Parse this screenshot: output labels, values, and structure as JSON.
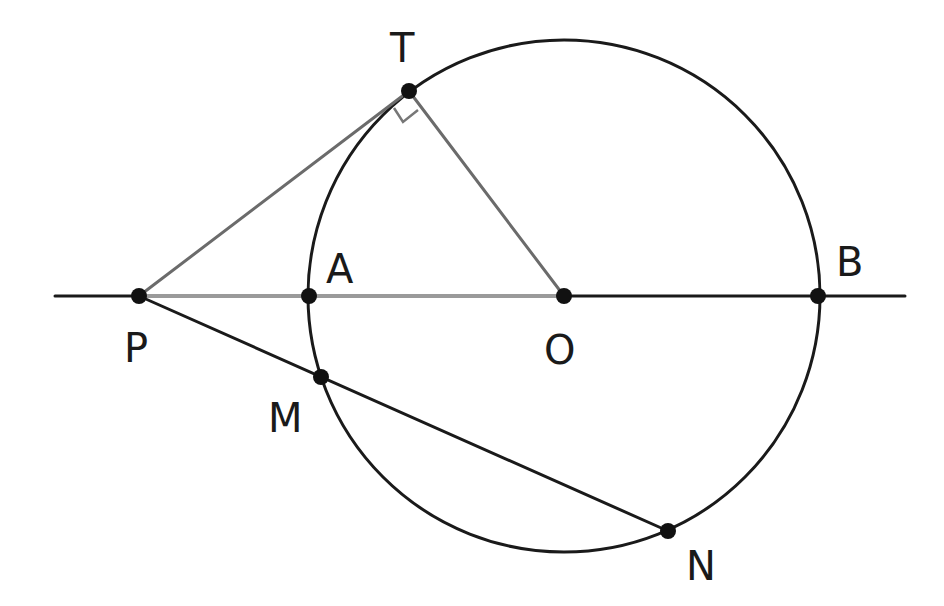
{
  "colors": {
    "background": "#ffffff",
    "stroke_dark": "#1a1a1a",
    "stroke_grey": "#6b6b6b",
    "stroke_light_grey": "#9a9a9a",
    "point": "#111111"
  },
  "circle": {
    "center": "O",
    "cx": 564,
    "cy": 296,
    "r": 256
  },
  "points": [
    {
      "id": "T",
      "label": "T",
      "x": 409,
      "y": 91,
      "label_x": 390,
      "label_y": 62
    },
    {
      "id": "P",
      "label": "P",
      "x": 139,
      "y": 296,
      "label_x": 124,
      "label_y": 362
    },
    {
      "id": "A",
      "label": "A",
      "x": 309,
      "y": 296,
      "label_x": 326,
      "label_y": 283
    },
    {
      "id": "O",
      "label": "O",
      "x": 564,
      "y": 296,
      "label_x": 544,
      "label_y": 364
    },
    {
      "id": "B",
      "label": "B",
      "x": 818,
      "y": 296,
      "label_x": 836,
      "label_y": 276
    },
    {
      "id": "M",
      "label": "M",
      "x": 321,
      "y": 377,
      "label_x": 268,
      "label_y": 432
    },
    {
      "id": "N",
      "label": "N",
      "x": 668,
      "y": 531,
      "label_x": 686,
      "label_y": 580
    }
  ],
  "segments": [
    {
      "name": "line-PB-extended",
      "from": [
        55,
        296
      ],
      "to": [
        905,
        296
      ],
      "color": "stroke_dark",
      "width": 3
    },
    {
      "name": "segment-PO",
      "from": [
        139,
        296
      ],
      "to": [
        564,
        296
      ],
      "color": "stroke_light_grey",
      "width": 4
    },
    {
      "name": "tangent-PT",
      "from": [
        139,
        296
      ],
      "to": [
        409,
        91
      ],
      "color": "stroke_grey",
      "width": 3
    },
    {
      "name": "radius-OT",
      "from": [
        409,
        91
      ],
      "to": [
        564,
        296
      ],
      "color": "stroke_grey",
      "width": 3
    },
    {
      "name": "secant-PN",
      "from": [
        139,
        296
      ],
      "to": [
        668,
        531
      ],
      "color": "stroke_dark",
      "width": 3
    }
  ],
  "right_angle": {
    "at": "T",
    "marker": [
      [
        394,
        108
      ],
      [
        403,
        122
      ],
      [
        418,
        110
      ]
    ]
  }
}
